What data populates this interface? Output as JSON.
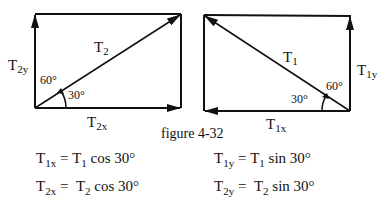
{
  "figure": {
    "caption": "figure 4-32",
    "left_diagram": {
      "vector_main": {
        "name": "T",
        "sub": "2"
      },
      "vector_y": {
        "name": "T",
        "sub": "2y"
      },
      "vector_x": {
        "name": "T",
        "sub": "2x"
      },
      "angle_top": "60°",
      "angle_bottom": "30°"
    },
    "right_diagram": {
      "vector_main": {
        "name": "T",
        "sub": "1"
      },
      "vector_y": {
        "name": "T",
        "sub": "1y"
      },
      "vector_x": {
        "name": "T",
        "sub": "1x"
      },
      "angle_top": "60°",
      "angle_bottom": "30°"
    }
  },
  "equations": [
    {
      "lhs": {
        "name": "T",
        "sub": "1x"
      },
      "eq": "=",
      "rhs": {
        "name": "T",
        "sub": "1",
        "func": "cos 30°"
      }
    },
    {
      "lhs": {
        "name": "T",
        "sub": "1y"
      },
      "eq": "=",
      "rhs": {
        "name": "T",
        "sub": "1",
        "func": "sin 30°"
      }
    },
    {
      "lhs": {
        "name": "T",
        "sub": "2x"
      },
      "eq": "=",
      "rhs": {
        "name": "T",
        "sub": "2",
        "func": "cos 30°"
      }
    },
    {
      "lhs": {
        "name": "T",
        "sub": "2y"
      },
      "eq": "=",
      "rhs": {
        "name": "T",
        "sub": "2",
        "func": "sin 30°"
      }
    }
  ]
}
